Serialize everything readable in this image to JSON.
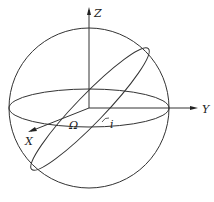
{
  "diagram": {
    "axes": {
      "z_label": "Z",
      "y_label": "Y",
      "x_label": "X"
    },
    "angles": {
      "node_label": "Ω",
      "inclination_label": "i"
    },
    "colors": {
      "line": "#333333",
      "background": "#ffffff"
    }
  }
}
